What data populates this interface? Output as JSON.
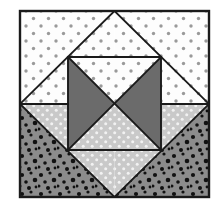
{
  "figure": {
    "kind": "quilt-block-diagram",
    "canvas": {
      "width": 224,
      "height": 206
    },
    "frame": {
      "x": 20,
      "y": 11,
      "width": 189,
      "height": 186,
      "stroke": "#1a1a1a",
      "stroke_width": 2.4
    }
  },
  "palette": {
    "background": "#ffffff",
    "white_fabric": "#fdfdfd",
    "light_gray_fabric": "#c9c9c9",
    "medium_gray_fabric": "#8c8c8c",
    "dark_gray_fabric": "#6b6b6b",
    "outline": "#1a1a1a",
    "gray_dot": "#9a9a9a",
    "black_dot": "#111111",
    "white_dot": "#f2f2f2"
  },
  "geometry": {
    "frame_left": 20,
    "frame_right": 209,
    "frame_top": 11,
    "frame_bottom": 197,
    "center_x": 114.5,
    "center_y": 104,
    "inner_left": 68,
    "inner_right": 161,
    "inner_top": 57,
    "inner_bottom": 150
  },
  "patches": [
    {
      "name": "top-left-corner-triangle",
      "fabric": "white-dotted",
      "fill": "#fdfdfd",
      "texture": "gray-dots",
      "points": "20,11 114.5,11 20,104"
    },
    {
      "name": "top-right-corner-triangle",
      "fabric": "white-dotted",
      "fill": "#fdfdfd",
      "texture": "gray-dots",
      "points": "114.5,11 209,11 209,104"
    },
    {
      "name": "bottom-left-corner-triangle",
      "fabric": "medium-gray-speckled",
      "fill": "#8c8c8c",
      "texture": "black-dots",
      "points": "20,104 114.5,197 20,197"
    },
    {
      "name": "bottom-right-corner-triangle",
      "fabric": "medium-gray-speckled",
      "fill": "#8c8c8c",
      "texture": "black-dots",
      "points": "209,104 209,197 114.5,197"
    },
    {
      "name": "diamond-upper-left-wedge",
      "fabric": "white-dotted",
      "fill": "#fdfdfd",
      "texture": "gray-dots",
      "points": "20,104 68,57 68,104"
    },
    {
      "name": "diamond-upper-right-wedge",
      "fabric": "white-dotted",
      "fill": "#fdfdfd",
      "texture": "gray-dots",
      "points": "161,57 209,104 161,104"
    },
    {
      "name": "diamond-lower-left-wedge",
      "fabric": "light-gray-dotted",
      "fill": "#c9c9c9",
      "texture": "white-dots",
      "points": "20,104 68,104 68,150"
    },
    {
      "name": "diamond-lower-right-wedge",
      "fabric": "light-gray-dotted",
      "fill": "#c9c9c9",
      "texture": "white-dots",
      "points": "161,104 209,104 161,150"
    },
    {
      "name": "inner-top-left-triangle",
      "fabric": "white-dotted",
      "fill": "#fdfdfd",
      "texture": "gray-dots",
      "points": "68,57 114.5,11 114.5,57"
    },
    {
      "name": "inner-top-right-triangle",
      "fabric": "white-dotted",
      "fill": "#fdfdfd",
      "texture": "gray-dots",
      "points": "114.5,11 161,57 114.5,57"
    },
    {
      "name": "inner-bottom-left-triangle",
      "fabric": "light-gray-dotted",
      "fill": "#c9c9c9",
      "texture": "white-dots",
      "points": "68,150 114.5,150 114.5,197"
    },
    {
      "name": "inner-bottom-right-triangle",
      "fabric": "light-gray-dotted",
      "fill": "#c9c9c9",
      "texture": "white-dots",
      "points": "114.5,150 161,150 114.5,197"
    },
    {
      "name": "hourglass-north-triangle",
      "fabric": "white-dotted",
      "fill": "#fdfdfd",
      "texture": "gray-dots",
      "points": "68,57 161,57 114.5,104"
    },
    {
      "name": "hourglass-west-triangle",
      "fabric": "dark-gray-solid",
      "fill": "#6b6b6b",
      "texture": "none",
      "points": "68,57 114.5,104 68,150"
    },
    {
      "name": "hourglass-east-triangle",
      "fabric": "dark-gray-solid",
      "fill": "#6b6b6b",
      "texture": "none",
      "points": "161,57 161,150 114.5,104"
    },
    {
      "name": "hourglass-south-triangle",
      "fabric": "light-gray-dotted",
      "fill": "#c9c9c9",
      "texture": "white-dots",
      "points": "68,150 114.5,104 161,150"
    }
  ],
  "seam_lines": [
    {
      "name": "diamond-upper-left-seam",
      "x1": 20,
      "y1": 104,
      "x2": 114.5,
      "y2": 11
    },
    {
      "name": "diamond-upper-right-seam",
      "x1": 114.5,
      "y1": 11,
      "x2": 209,
      "y2": 104
    },
    {
      "name": "diamond-lower-left-seam",
      "x1": 20,
      "y1": 104,
      "x2": 114.5,
      "y2": 197
    },
    {
      "name": "diamond-lower-right-seam",
      "x1": 114.5,
      "y1": 197,
      "x2": 209,
      "y2": 104
    },
    {
      "name": "horizontal-midline-left",
      "x1": 20,
      "y1": 104,
      "x2": 68,
      "y2": 104
    },
    {
      "name": "horizontal-midline-right",
      "x1": 161,
      "y1": 104,
      "x2": 209,
      "y2": 104
    },
    {
      "name": "inner-square-left-seam",
      "x1": 68,
      "y1": 57,
      "x2": 68,
      "y2": 150
    },
    {
      "name": "inner-square-right-seam",
      "x1": 161,
      "y1": 57,
      "x2": 161,
      "y2": 150
    },
    {
      "name": "inner-square-top-seam",
      "x1": 68,
      "y1": 57,
      "x2": 161,
      "y2": 57
    },
    {
      "name": "inner-square-bottom-seam",
      "x1": 68,
      "y1": 150,
      "x2": 161,
      "y2": 150
    },
    {
      "name": "hourglass-nw-se-seam",
      "x1": 68,
      "y1": 57,
      "x2": 161,
      "y2": 150
    },
    {
      "name": "hourglass-ne-sw-seam",
      "x1": 161,
      "y1": 57,
      "x2": 68,
      "y2": 150
    }
  ]
}
